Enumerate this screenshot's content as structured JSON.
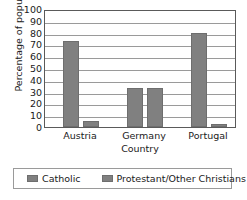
{
  "chart_data": {
    "type": "bar",
    "title": "",
    "subtitle": "",
    "xlabel": "Country",
    "ylabel": "Percentage of population",
    "categories": [
      "Austria",
      "Germany",
      "Portugal"
    ],
    "series": [
      {
        "name": "Catholic",
        "values": [
          74,
          34,
          81
        ],
        "color": "#808080"
      },
      {
        "name": "Protestant/Other Christians",
        "values": [
          5,
          34,
          3
        ],
        "color": "#808080"
      }
    ],
    "ylim": [
      0,
      100
    ],
    "yticks": [
      0,
      10,
      20,
      30,
      40,
      50,
      60,
      70,
      80,
      90,
      100
    ],
    "ytick_labels": [
      "0",
      "10",
      "20",
      "30",
      "40",
      "50",
      "60",
      "70",
      "80",
      "90",
      "100"
    ],
    "grid": "horizontal",
    "legend_position": "bottom",
    "bar_color": "#808080",
    "grid_color": "#9a9a9a",
    "frame_color": "#5a5a5a"
  }
}
